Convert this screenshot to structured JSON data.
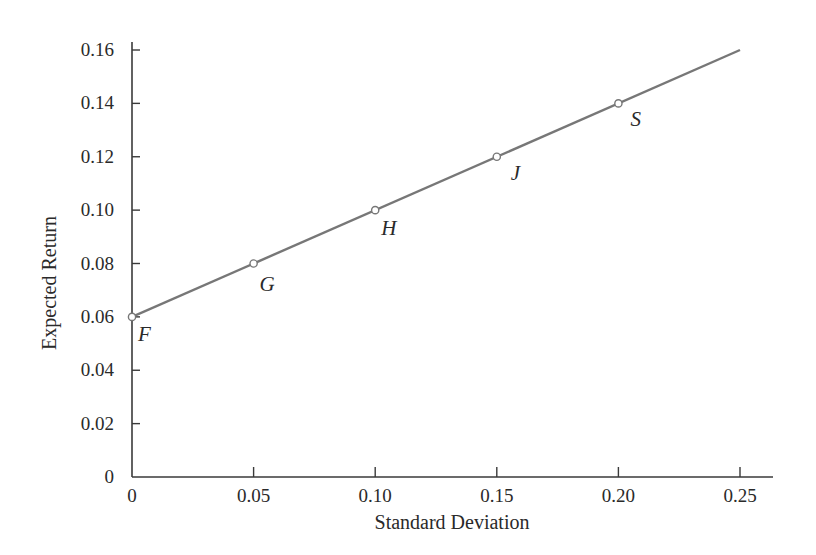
{
  "chart_data": {
    "type": "line",
    "title": "",
    "xlabel": "Standard Deviation",
    "ylabel": "Expected Return",
    "xlim": [
      0,
      0.25
    ],
    "ylim": [
      0,
      0.16
    ],
    "x_ticks": [
      "0",
      "0.05",
      "0.10",
      "0.15",
      "0.20",
      "0.25"
    ],
    "y_ticks": [
      "0",
      "0.02",
      "0.04",
      "0.06",
      "0.08",
      "0.10",
      "0.12",
      "0.14",
      "0.16"
    ],
    "grid": false,
    "legend": null,
    "series": [
      {
        "name": "Capital Allocation Line",
        "x": [
          0,
          0.25
        ],
        "y": [
          0.06,
          0.16
        ],
        "color": "#777777"
      }
    ],
    "points": [
      {
        "label": "F",
        "x": 0.0,
        "y": 0.06
      },
      {
        "label": "G",
        "x": 0.05,
        "y": 0.08
      },
      {
        "label": "H",
        "x": 0.1,
        "y": 0.1
      },
      {
        "label": "J",
        "x": 0.15,
        "y": 0.12
      },
      {
        "label": "S",
        "x": 0.2,
        "y": 0.14
      }
    ]
  },
  "colors": {
    "axis": "#3a3a3a",
    "line": "#777777",
    "text": "#2a2a2a",
    "marker_fill": "#ffffff"
  }
}
